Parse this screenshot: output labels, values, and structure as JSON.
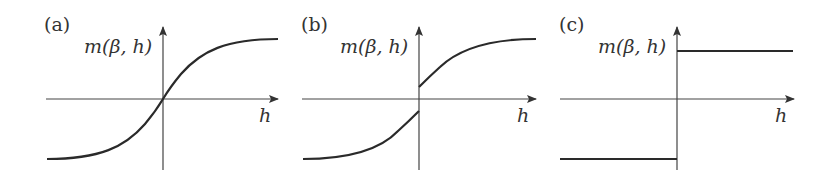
{
  "figure": {
    "colors": {
      "curve": "#2a2a2a",
      "axis": "#444444",
      "text": "#333333",
      "background": "#ffffff"
    },
    "panels": [
      {
        "id": "a",
        "label": "(a)",
        "y_axis_label": "m(β, h)",
        "x_axis_label": "h",
        "curve_type": "smooth sigmoid through origin (continuous)"
      },
      {
        "id": "b",
        "label": "(b)",
        "y_axis_label": "m(β, h)",
        "x_axis_label": "h",
        "curve_type": "sigmoid with jump discontinuity at h = 0"
      },
      {
        "id": "c",
        "label": "(c)",
        "y_axis_label": "m(β, h)",
        "x_axis_label": "h",
        "curve_type": "step function (sign of h)"
      }
    ]
  }
}
